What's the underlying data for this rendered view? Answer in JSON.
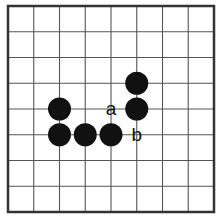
{
  "board": {
    "type": "gomoku-go-diagram",
    "lines": 9,
    "cells": 8,
    "origin": {
      "x": 8,
      "y": 6
    },
    "cell_size": 25.75,
    "line_color": "#555555",
    "border_color": "#333333",
    "background": "#ffffff"
  },
  "stones": [
    {
      "color": "black",
      "col": 2,
      "row": 4
    },
    {
      "color": "black",
      "col": 2,
      "row": 5
    },
    {
      "color": "black",
      "col": 3,
      "row": 5
    },
    {
      "color": "black",
      "col": 4,
      "row": 5
    },
    {
      "color": "black",
      "col": 5,
      "row": 3
    },
    {
      "color": "black",
      "col": 5,
      "row": 4
    }
  ],
  "labels": [
    {
      "text": "a",
      "col": 4,
      "row": 4
    },
    {
      "text": "b",
      "col": 5,
      "row": 5
    }
  ],
  "stone_color": "#111111"
}
